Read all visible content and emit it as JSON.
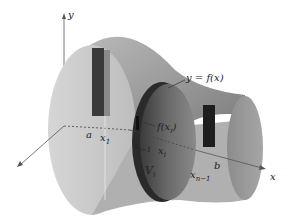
{
  "figure": {
    "axes": {
      "x_label": "x",
      "y_label": "y"
    },
    "curve_label": "y = f(x)",
    "radius_label": "f(x",
    "radius_label_sub": "i",
    "radius_label_close": ")",
    "interval_labels": {
      "a": "a",
      "x1": "x",
      "x1_sub": "1",
      "xim1": "x",
      "xim1_sub": "i−1",
      "xi": "x",
      "xi_sub": "i",
      "xnm1": "x",
      "xnm1_sub": "n−1",
      "b": "b"
    },
    "slab_label": "V",
    "slab_label_sub": "i",
    "colors": {
      "surface_light": "#c9c9c9",
      "surface_mid": "#a8a8a8",
      "surface_dark": "#6e6e6e",
      "slab_dark": "#2e2e2e",
      "axis": "#555555",
      "background": "#ffffff"
    }
  }
}
